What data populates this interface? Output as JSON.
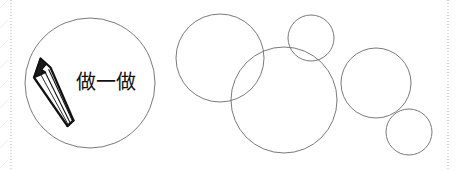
{
  "page": {
    "width": 456,
    "height": 171,
    "background_color": "#ffffff",
    "stroke_color": "#7a7a7a",
    "ink_color": "#111111",
    "guide_color": "#b9b9b9"
  },
  "activity_badge": {
    "label": "做一做",
    "label_x": 76,
    "label_y": 72,
    "font_size": 20,
    "icon_name": "pencil-icon",
    "circle": {
      "cx": 90,
      "cy": 83,
      "r": 65
    }
  },
  "guides": {
    "left_margin_x": 11,
    "right_margin_x": 448,
    "style": "dotted"
  },
  "chart_data": {
    "type": "diagram",
    "title": "",
    "units": "px",
    "circles": [
      {
        "name": "badge-circle",
        "cx": 90,
        "cy": 83,
        "r": 65,
        "fill": "none",
        "stroke": "#7a7a7a"
      },
      {
        "name": "circle-1",
        "cx": 220,
        "cy": 58,
        "r": 44,
        "fill": "none",
        "stroke": "#7a7a7a"
      },
      {
        "name": "circle-2",
        "cx": 284,
        "cy": 100,
        "r": 53,
        "fill": "none",
        "stroke": "#7a7a7a"
      },
      {
        "name": "circle-3",
        "cx": 311,
        "cy": 38,
        "r": 23,
        "fill": "none",
        "stroke": "#7a7a7a"
      },
      {
        "name": "circle-4",
        "cx": 376,
        "cy": 83,
        "r": 35,
        "fill": "none",
        "stroke": "#7a7a7a"
      },
      {
        "name": "circle-5",
        "cx": 409,
        "cy": 132,
        "r": 23,
        "fill": "none",
        "stroke": "#7a7a7a"
      }
    ]
  }
}
